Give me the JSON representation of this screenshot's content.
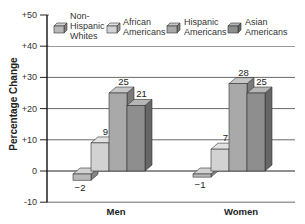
{
  "chart_data": {
    "type": "bar",
    "style": "3d-clustered-column",
    "title": "",
    "xlabel": "",
    "ylabel": "Percentage Change",
    "ylim": [
      -10,
      50
    ],
    "yticks": [
      50,
      40,
      30,
      20,
      10,
      0,
      -10
    ],
    "ytick_labels": [
      "+50",
      "+40",
      "+30",
      "+20",
      "+10",
      "0",
      "-10"
    ],
    "grid": true,
    "legend_position": "top",
    "categories": [
      "Men",
      "Women"
    ],
    "series": [
      {
        "name": "Non-Hispanic Whites",
        "legend_lines": [
          "Non-",
          "Hispanic",
          "Whites"
        ],
        "values": [
          -2,
          -1
        ],
        "labels": [
          "−2",
          "−1"
        ],
        "color": "#b8b8b8"
      },
      {
        "name": "African Americans",
        "legend_lines": [
          "African",
          "Americans"
        ],
        "values": [
          9,
          7
        ],
        "labels": [
          "9",
          "7"
        ],
        "color": "#d2d2d2"
      },
      {
        "name": "Hispanic Americans",
        "legend_lines": [
          "Hispanic",
          "Americans"
        ],
        "values": [
          25,
          28
        ],
        "labels": [
          "25",
          "28"
        ],
        "color": "#a9a9a9"
      },
      {
        "name": "Asian Americans",
        "legend_lines": [
          "Asian",
          "Americans"
        ],
        "values": [
          21,
          25
        ],
        "labels": [
          "21",
          "25"
        ],
        "color": "#8e8e8e"
      }
    ]
  }
}
